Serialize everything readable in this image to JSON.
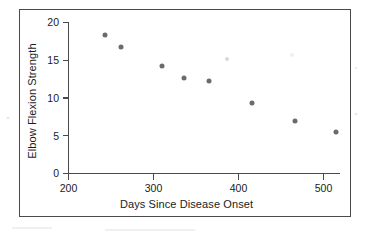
{
  "chart_data": {
    "type": "scatter",
    "title": "",
    "xlabel": "Days Since Disease Onset",
    "ylabel": "Elbow Flexion Strength",
    "xlim": [
      200,
      530
    ],
    "ylim": [
      0,
      20
    ],
    "xticks": [
      200,
      300,
      400,
      500
    ],
    "yticks": [
      0,
      5,
      10,
      15,
      20
    ],
    "xtick_labels": [
      "200",
      "300",
      "400",
      "500"
    ],
    "ytick_labels": [
      "0",
      "5",
      "10",
      "15",
      "20"
    ],
    "grid": false,
    "legend": "none",
    "marker": "filled-circle",
    "marker_color": "#6b6b6b",
    "axis_color": "#4a4a4a",
    "frame": true,
    "points": [
      {
        "x": 243,
        "y": 18.4
      },
      {
        "x": 262,
        "y": 16.7
      },
      {
        "x": 310,
        "y": 14.2
      },
      {
        "x": 336,
        "y": 12.7
      },
      {
        "x": 365,
        "y": 12.2
      },
      {
        "x": 387,
        "y": 15.2
      },
      {
        "x": 416,
        "y": 9.3
      },
      {
        "x": 463,
        "y": 15.7
      },
      {
        "x": 467,
        "y": 7.0
      },
      {
        "x": 515,
        "y": 5.5
      }
    ],
    "series": [
      {
        "name": "Elbow Flexion Strength vs Days Since Disease Onset",
        "x": [
          243,
          262,
          310,
          336,
          365,
          387,
          416,
          463,
          467,
          515
        ],
        "values": [
          18.4,
          16.7,
          14.2,
          12.7,
          12.2,
          15.2,
          9.3,
          15.7,
          7.0,
          5.5
        ]
      }
    ]
  },
  "axes": {
    "x_label": "Days Since Disease Onset",
    "y_label": "Elbow Flexion Strength",
    "x_ticks": [
      {
        "label": "200",
        "value": 200
      },
      {
        "label": "300",
        "value": 300
      },
      {
        "label": "400",
        "value": 400
      },
      {
        "label": "500",
        "value": 500
      }
    ],
    "y_ticks": [
      {
        "label": "0",
        "value": 0
      },
      {
        "label": "5",
        "value": 5
      },
      {
        "label": "10",
        "value": 10
      },
      {
        "label": "15",
        "value": 15
      },
      {
        "label": "20",
        "value": 20
      }
    ]
  },
  "colors": {
    "marker": "#6b6b6b",
    "axis": "#4a4a4a",
    "frame": "#4a4a4a",
    "text": "#1b1b1b",
    "background": "#ffffff"
  }
}
